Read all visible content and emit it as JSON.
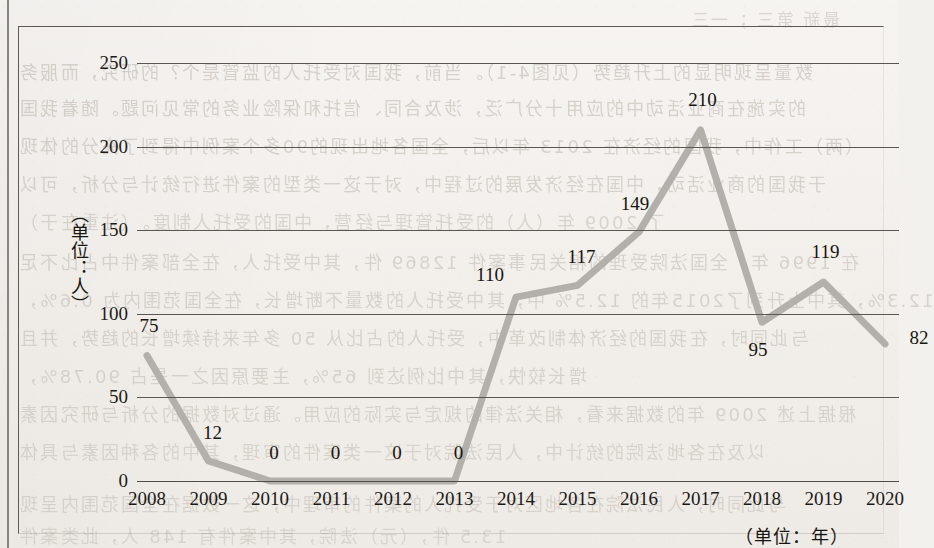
{
  "chart_data": {
    "type": "line",
    "title": "",
    "xlabel": "（单位：年）",
    "ylabel": "（单位：人）",
    "categories": [
      "2008",
      "2009",
      "2010",
      "2011",
      "2012",
      "2013",
      "2014",
      "2015",
      "2016",
      "2017",
      "2018",
      "2019",
      "2020"
    ],
    "values": [
      75,
      12,
      0,
      0,
      0,
      0,
      110,
      117,
      149,
      210,
      95,
      119,
      82
    ],
    "value_labels": [
      "75",
      "12",
      "0",
      "0",
      "0",
      "0",
      "110",
      "117",
      "149",
      "210",
      "95",
      "119",
      "82"
    ],
    "ylim": [
      0,
      250
    ],
    "yticks": [
      0,
      50,
      100,
      150,
      200,
      250
    ],
    "ytick_labels": [
      "0",
      "50",
      "100",
      "150",
      "200",
      "250"
    ],
    "grid": true,
    "legend": false,
    "series_color": "#b3b0ac",
    "gridline_color": "#5a5752",
    "text_color": "#17150f"
  },
  "label_offsets": [
    {
      "dx": 2,
      "dy": -30
    },
    {
      "dx": 4,
      "dy": -28
    },
    {
      "dx": 4,
      "dy": -28
    },
    {
      "dx": 4,
      "dy": -28
    },
    {
      "dx": 4,
      "dy": -28
    },
    {
      "dx": 4,
      "dy": -28
    },
    {
      "dx": -26,
      "dy": -22
    },
    {
      "dx": 4,
      "dy": -28
    },
    {
      "dx": -4,
      "dy": -28
    },
    {
      "dx": 2,
      "dy": -30
    },
    {
      "dx": -4,
      "dy": 28
    },
    {
      "dx": 2,
      "dy": -30
    },
    {
      "dx": 34,
      "dy": -6
    }
  ],
  "page_bleed": {
    "lines": [
      {
        "top": 6,
        "left": 690,
        "text": "最新 第三 ；一三",
        "size": 17,
        "opacity": 0.3
      },
      {
        "top": 58,
        "left": 18,
        "text": "数量呈现明显的上升趋势（见图4-1）。当前，我国对受托人的监管是个？的研究，而服务",
        "size": 18,
        "opacity": 0.34
      },
      {
        "top": 94,
        "left": 18,
        "text": "的实施在商业活动中的应用十分广泛，涉及合同、信托和保险业务的常见问题。随着我国",
        "size": 18,
        "opacity": 0.34
      },
      {
        "top": 132,
        "left": 18,
        "text": "（两）工作中，我国的经济在 2013 年以后，全国各地出现的90多个案例中得到了充分的体现",
        "size": 18,
        "opacity": 0.33
      },
      {
        "top": 170,
        "left": 18,
        "text": "于我国的商业活动，中国在经济发展的过程中，对于这一类型的案件进行统计与分析，可以",
        "size": 18,
        "opacity": 0.32
      },
      {
        "top": 208,
        "left": 18,
        "text": "了 2009 年（人）的受托管理与经营，中国的受托人制度。（注重在于）",
        "size": 18,
        "opacity": 0.3
      },
      {
        "top": 248,
        "left": 18,
        "text": "在 1996 年，全国法院受理的相关民事案件 12869 件，其中受托人，在全部案件中占比不足",
        "size": 18,
        "opacity": 0.31
      },
      {
        "top": 286,
        "left": 18,
        "text": "12.3%，其中上升到了2015年的 12.5% 中，其中受托人的数量不断增长，在全国范围内为 0.6%，",
        "size": 18,
        "opacity": 0.31
      },
      {
        "top": 324,
        "left": 18,
        "text": "与此同时，在我国的经济体制改革中，受托人的占比从 50 多年来持续增长的趋势，并且",
        "size": 18,
        "opacity": 0.3
      },
      {
        "top": 362,
        "left": 18,
        "text": "增长较快，其中比例达到 65%，主要原因之一是占 90.78%，",
        "size": 18,
        "opacity": 0.3
      },
      {
        "top": 400,
        "left": 18,
        "text": "根据上述 2009 年的数据来看，相关法律的规定与实际的应用。通过对数据的分析与研究因素",
        "size": 18,
        "opacity": 0.29
      },
      {
        "top": 438,
        "left": 18,
        "text": "以及在各地法院的统计中，人民法院对于这一类案件的审理，其中的各种因素与具体",
        "size": 18,
        "opacity": 0.28
      },
      {
        "top": 490,
        "left": 18,
        "text": "与此同时，人民法院在各地区对于受托人的案件的审理中，这一数据在全国范围内呈现",
        "size": 18,
        "opacity": 0.28
      },
      {
        "top": 522,
        "left": 18,
        "text": "13.5 件，（元）法院，其中案件有 148 人，此类案件",
        "size": 18,
        "opacity": 0.26
      }
    ]
  }
}
